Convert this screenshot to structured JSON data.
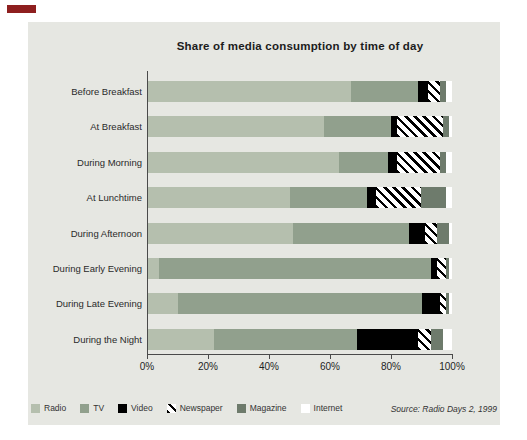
{
  "corner_marker_color": "#8e1f1f",
  "panel_bg": "#e6e7e2",
  "axis_color": "#4a4a4a",
  "chart_data": {
    "type": "bar",
    "stacked": true,
    "orientation": "horizontal",
    "title": "Share of media consumption by time of day",
    "categories": [
      "Before Breakfast",
      "At Breakfast",
      "During Morning",
      "At Lunchtime",
      "During Afternoon",
      "During Early Evening",
      "During Late Evening",
      "During the Night"
    ],
    "series": [
      {
        "name": "Radio",
        "color": "#b5bfae",
        "pattern": "solid",
        "values": [
          67,
          58,
          63,
          47,
          48,
          4,
          10,
          22
        ]
      },
      {
        "name": "TV",
        "color": "#91a08d",
        "pattern": "solid",
        "values": [
          22,
          22,
          16,
          25,
          38,
          89,
          80,
          47
        ]
      },
      {
        "name": "Video",
        "color": "#000000",
        "pattern": "solid",
        "values": [
          3,
          2,
          3,
          3,
          5,
          2,
          6,
          20
        ]
      },
      {
        "name": "Newspaper",
        "color": "#ffffff",
        "pattern": "diagonal-hatch",
        "values": [
          4,
          15,
          14,
          15,
          4,
          3,
          2,
          4
        ]
      },
      {
        "name": "Magazine",
        "color": "#6e7b6c",
        "pattern": "solid",
        "values": [
          2,
          2,
          2,
          8,
          4,
          1,
          1,
          4
        ]
      },
      {
        "name": "Internet",
        "color": "#ffffff",
        "pattern": "solid",
        "values": [
          2,
          1,
          2,
          2,
          1,
          1,
          1,
          3
        ]
      }
    ],
    "x_ticks": [
      "0%",
      "20%",
      "40%",
      "60%",
      "80%",
      "100%"
    ],
    "xlim": [
      0,
      100
    ],
    "grid": false,
    "legend_position": "bottom",
    "source": "Source: Radio Days 2, 1999"
  }
}
